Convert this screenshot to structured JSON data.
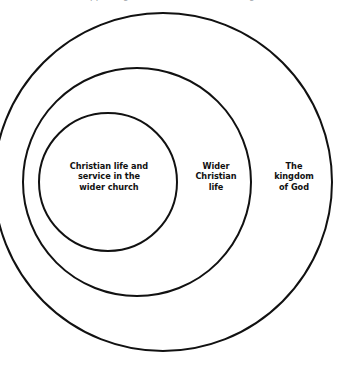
{
  "diagram": {
    "type": "concentric-circles",
    "title_fragment_clipped": "Supporting the wider church (see diagram)",
    "background_color": "#ffffff",
    "stroke_color": "#111111",
    "text_color": "#111111",
    "rings": [
      {
        "id": "outer",
        "label": "The\nkingdom\nof God",
        "label_lines": [
          "The",
          "kingdom",
          "of God"
        ],
        "center_x": 163,
        "center_y": 182,
        "radius": 169,
        "stroke_width": 2
      },
      {
        "id": "middle",
        "label": "Wider\nChristian\nlife",
        "label_lines": [
          "Wider",
          "Christian",
          "life"
        ],
        "center_x": 137,
        "center_y": 182,
        "radius": 114,
        "stroke_width": 2
      },
      {
        "id": "inner",
        "label": "Christian life and\nservice in the\nwider church",
        "label_lines": [
          "Christian life and",
          "service in the",
          "wider church"
        ],
        "center_x": 108,
        "center_y": 182,
        "radius": 69,
        "stroke_width": 2
      }
    ],
    "labels": {
      "inner": "Christian life and service in the wider church",
      "middle": "Wider Christian life",
      "outer": "The kingdom of God"
    }
  }
}
